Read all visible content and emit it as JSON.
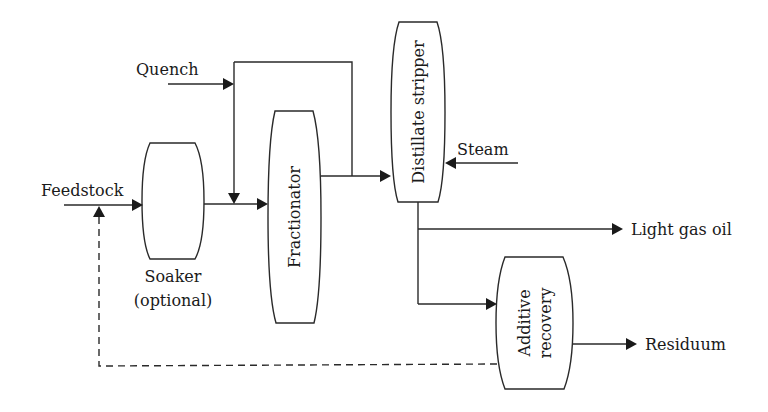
{
  "diagram": {
    "type": "process-flow",
    "nodes": {
      "soaker": {
        "label_line1": "Soaker",
        "label_line2": "(optional)"
      },
      "fractionator": {
        "label": "Fractionator"
      },
      "distillate_stripper": {
        "label": "Distillate stripper"
      },
      "additive_recovery": {
        "label_line1": "Additive",
        "label_line2": "recovery"
      }
    },
    "streams": {
      "feedstock": "Feedstock",
      "quench": "Quench",
      "steam": "Steam",
      "light_gas_oil": "Light gas oil",
      "residuum": "Residuum"
    },
    "edges": [
      {
        "from": "Feedstock",
        "to": "Soaker",
        "style": "solid"
      },
      {
        "from": "Soaker",
        "to": "Fractionator",
        "style": "solid"
      },
      {
        "from": "Quench",
        "to": "Fractionator inlet",
        "style": "solid"
      },
      {
        "from": "Fractionator",
        "to": "Distillate stripper",
        "style": "solid"
      },
      {
        "from": "Steam",
        "to": "Distillate stripper",
        "style": "solid"
      },
      {
        "from": "Distillate stripper",
        "to": "Light gas oil",
        "style": "solid"
      },
      {
        "from": "Distillate stripper",
        "to": "Additive recovery",
        "style": "solid"
      },
      {
        "from": "Additive recovery",
        "to": "Residuum",
        "style": "solid"
      },
      {
        "from": "Additive recovery",
        "to": "Feedstock",
        "style": "dashed"
      }
    ]
  }
}
